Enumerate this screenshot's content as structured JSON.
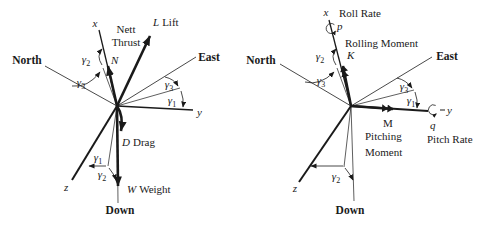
{
  "colors": {
    "ink": "#1a1a1a",
    "background": "#ffffff"
  },
  "shared": {
    "gamma": "γ",
    "sub1": "1",
    "sub2": "2",
    "sub3": "3"
  },
  "left": {
    "axis_x": "x",
    "axis_y": "y",
    "axis_z": "z",
    "north": "North",
    "east": "East",
    "down": "Down",
    "thrust_word1": "Nett",
    "thrust_word2": "Thrust",
    "thrust_symbol": "N",
    "lift_symbol": "L",
    "lift_word": "Lift",
    "drag_symbol": "D",
    "drag_word": "Drag",
    "weight_symbol": "W",
    "weight_word": "Weight"
  },
  "right": {
    "axis_x": "x",
    "axis_y": "y",
    "axis_z": "z",
    "north": "North",
    "east": "East",
    "down": "Down",
    "roll_rate": "Roll Rate",
    "p": "p",
    "rolling_moment": "Rolling Moment",
    "k": "K",
    "m": "M",
    "pitching_word1": "Pitching",
    "pitching_word2": "Moment",
    "q": "q",
    "pitch_rate": "Pitch Rate"
  }
}
